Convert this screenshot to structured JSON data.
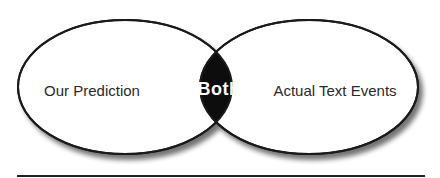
{
  "diagram": {
    "type": "venn",
    "left_set": {
      "label": "Our Prediction"
    },
    "right_set": {
      "label": "Actual Text Events"
    },
    "intersection": {
      "label": "Both"
    },
    "colors": {
      "outline": "#1a1a1a",
      "fill": "#ffffff",
      "intersection_fill": "#0d0d0d",
      "intersection_text": "#ffffff",
      "rule": "#222222"
    }
  }
}
